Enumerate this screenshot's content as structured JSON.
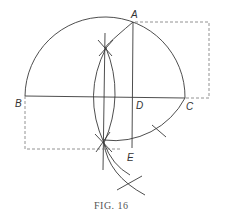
{
  "figure": {
    "caption": "FIG. 16",
    "labels": {
      "A": "A",
      "B": "B",
      "C": "C",
      "D": "D",
      "E": "E"
    }
  }
}
